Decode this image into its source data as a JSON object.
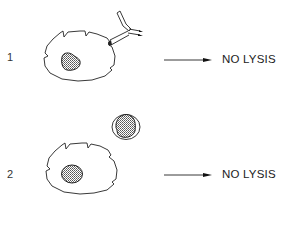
{
  "diagram": {
    "rows": [
      {
        "label": "1",
        "description": "target cell with bound antibody",
        "result": "NO LYSIS"
      },
      {
        "label": "2",
        "description": "target cell with separate effector cell",
        "result": "NO LYSIS"
      }
    ],
    "colors": {
      "stroke": "#222222",
      "nucleus_fill": "#9a9a9a",
      "background": "#ffffff"
    }
  }
}
